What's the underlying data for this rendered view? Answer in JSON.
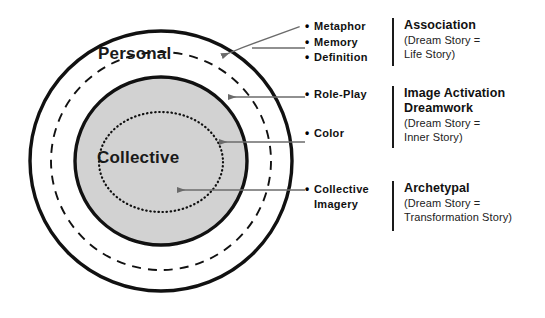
{
  "diagram": {
    "outer_label": "Personal",
    "inner_label": "Collective",
    "colors": {
      "stroke": "#111111",
      "inner_fill": "#d2d2d2",
      "leader_line": "#6b6b6b"
    },
    "rings": [
      {
        "name": "outer-solid-ellipse",
        "style": "solid",
        "fill": "none"
      },
      {
        "name": "dashed-ellipse",
        "style": "dashed",
        "fill": "none"
      },
      {
        "name": "collective-filled-ellipse",
        "style": "solid",
        "fill": "#d2d2d2"
      },
      {
        "name": "inner-dotted-ellipse",
        "style": "dotted",
        "fill": "none"
      }
    ]
  },
  "annotations": [
    {
      "bullets": [
        "Metaphor",
        "Memory",
        "Definition"
      ],
      "title": "Association",
      "equation_line_1": "(Dream Story  =",
      "equation_line_2": "Life Story)"
    },
    {
      "bullets": [
        "Role-Play",
        "Color"
      ],
      "title_line_1": "Image Activation",
      "title_line_2": "Dreamwork",
      "equation_line_1": "(Dream Story =",
      "equation_line_2": "Inner Story)"
    },
    {
      "bullets": [
        "Collective",
        "Imagery"
      ],
      "title": "Archetypal",
      "equation_line_1": "(Dream Story =",
      "equation_line_2": "Transformation Story)"
    }
  ]
}
